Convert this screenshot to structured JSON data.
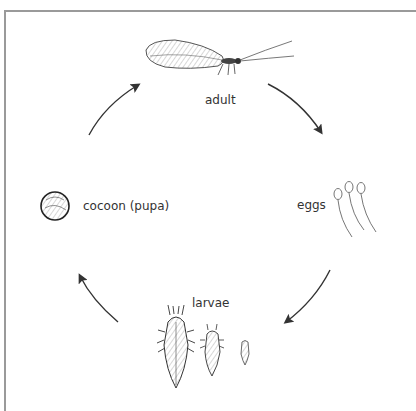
{
  "diagram": {
    "type": "life-cycle",
    "stages": [
      {
        "id": "adult",
        "label": "adult"
      },
      {
        "id": "eggs",
        "label": "eggs"
      },
      {
        "id": "larvae",
        "label": "larvae"
      },
      {
        "id": "cocoon",
        "label": "cocoon (pupa)"
      }
    ],
    "cycle_order": [
      "adult",
      "eggs",
      "larvae",
      "cocoon",
      "adult"
    ],
    "arrow_color": "#333333",
    "frame_color": "#9a9a9a"
  }
}
